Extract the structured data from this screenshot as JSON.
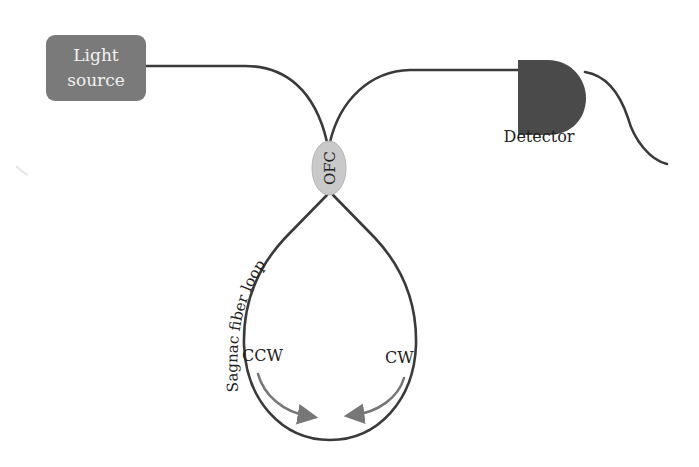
{
  "diagram": {
    "colors": {
      "fiber": "#3a3a3a",
      "light_source_fill": "#7a7a7a",
      "light_source_text": "#f2f2f2",
      "detector_fill": "#4a4a4a",
      "coupler_fill": "#c9c9c9",
      "arrow": "#777777",
      "text": "#222222"
    },
    "components": {
      "light_source": {
        "line1": "Light",
        "line2": "source"
      },
      "coupler": {
        "label": "OFC"
      },
      "detector": {
        "label": "Detector"
      },
      "loop": {
        "label": "Sagnac fiber loop"
      }
    },
    "directions": {
      "ccw": {
        "label": "CCW"
      },
      "cw": {
        "label": "CW"
      }
    }
  }
}
